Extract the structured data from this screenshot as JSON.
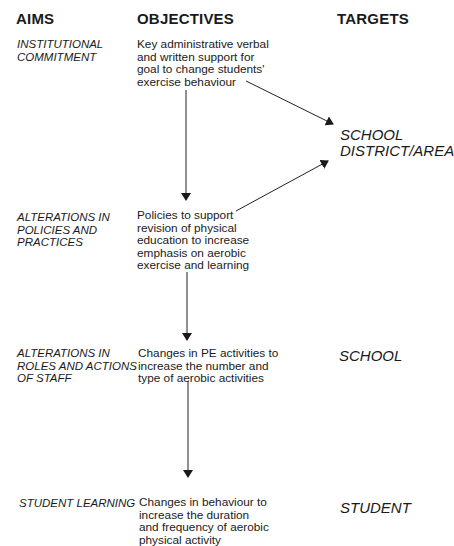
{
  "headers": {
    "aims": "AIMS",
    "objectives": "OBJECTIVES",
    "targets": "TARGETS"
  },
  "rows": [
    {
      "aim": "INSTITUTIONAL\nCOMMITMENT",
      "objective": "Key administrative verbal\nand written support for\ngoal to change students'\nexercise behaviour"
    },
    {
      "aim": "ALTERATIONS IN\nPOLICIES AND\nPRACTICES",
      "objective": "Policies to support\nrevision of physical\neducation to increase\nemphasis on aerobic\nexercise and learning"
    },
    {
      "aim": "ALTERATIONS IN\nROLES AND ACTIONS\nOF STAFF",
      "objective": "Changes in PE activities to\nincrease the number and\ntype of aerobic activities"
    },
    {
      "aim": "STUDENT LEARNING",
      "objective": "Changes in behaviour to\nincrease the duration\nand frequency of aerobic\nphysical activity"
    }
  ],
  "targets": [
    {
      "label": "SCHOOL\nDISTRICT/AREA"
    },
    {
      "label": "SCHOOL"
    },
    {
      "label": "STUDENT"
    }
  ],
  "arrows": [
    {
      "from": "rows.0.objective",
      "to": "rows.1.objective",
      "direction": "down"
    },
    {
      "from": "rows.1.objective",
      "to": "rows.2.objective",
      "direction": "down"
    },
    {
      "from": "rows.2.objective",
      "to": "rows.3.objective",
      "direction": "down"
    },
    {
      "from": "rows.0.objective",
      "to": "targets.0",
      "direction": "diagonal-down-right"
    },
    {
      "from": "rows.1.objective",
      "to": "targets.0",
      "direction": "diagonal-up-right"
    }
  ],
  "colors": {
    "text": "#1a1a1a",
    "line": "#222222",
    "background": "#ffffff"
  }
}
